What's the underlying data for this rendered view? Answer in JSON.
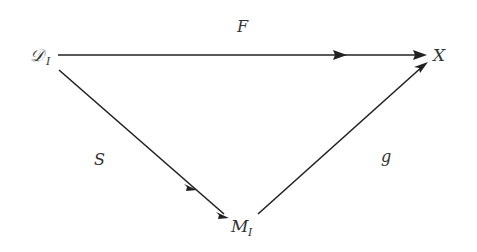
{
  "diagram": {
    "type": "commutative-diagram",
    "nodes": [
      {
        "id": "D_I",
        "label": "𝒟",
        "subscript": "I"
      },
      {
        "id": "X",
        "label": "X",
        "subscript": ""
      },
      {
        "id": "M_I",
        "label": "M",
        "subscript": "I"
      }
    ],
    "edges": [
      {
        "id": "F",
        "label": "F",
        "from": "D_I",
        "to": "X",
        "mid_arrow": true
      },
      {
        "id": "S",
        "label": "S",
        "from": "D_I",
        "to": "M_I",
        "mid_arrow": true
      },
      {
        "id": "g",
        "label": "g",
        "from": "M_I",
        "to": "X",
        "mid_arrow": false
      }
    ],
    "colors": {
      "stroke": "#222222",
      "text": "#333333",
      "background": "#ffffff"
    }
  }
}
